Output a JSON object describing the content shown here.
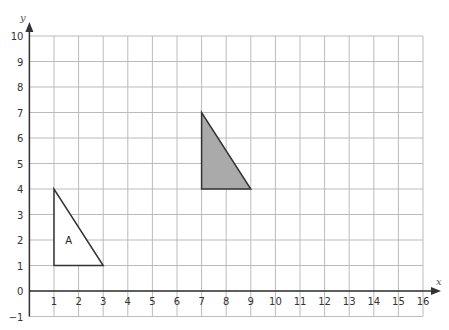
{
  "chart_data": {
    "type": "scatter",
    "title": "",
    "xlabel": "x",
    "ylabel": "y",
    "xlim": [
      0,
      16
    ],
    "ylim": [
      -1,
      10
    ],
    "grid": true,
    "x_ticks": [
      "1",
      "2",
      "3",
      "4",
      "5",
      "6",
      "7",
      "8",
      "9",
      "10",
      "11",
      "12",
      "13",
      "14",
      "15",
      "16"
    ],
    "y_ticks": [
      "-1",
      "0",
      "1",
      "2",
      "3",
      "4",
      "5",
      "6",
      "7",
      "8",
      "9",
      "10"
    ],
    "shapes": [
      {
        "name": "triangle-a",
        "label": "A",
        "vertices": [
          [
            1,
            4
          ],
          [
            1,
            1
          ],
          [
            3,
            1
          ]
        ],
        "fill": "#ffffff",
        "stroke": "#333333",
        "label_pos": [
          1.6,
          2
        ]
      },
      {
        "name": "shaded-triangle",
        "label": "",
        "vertices": [
          [
            7,
            7
          ],
          [
            7,
            4
          ],
          [
            9,
            4
          ]
        ],
        "fill": "#aaaaaa",
        "stroke": "#333333"
      }
    ]
  },
  "colors": {
    "grid": "#bbbbbb",
    "axis": "#333333"
  }
}
